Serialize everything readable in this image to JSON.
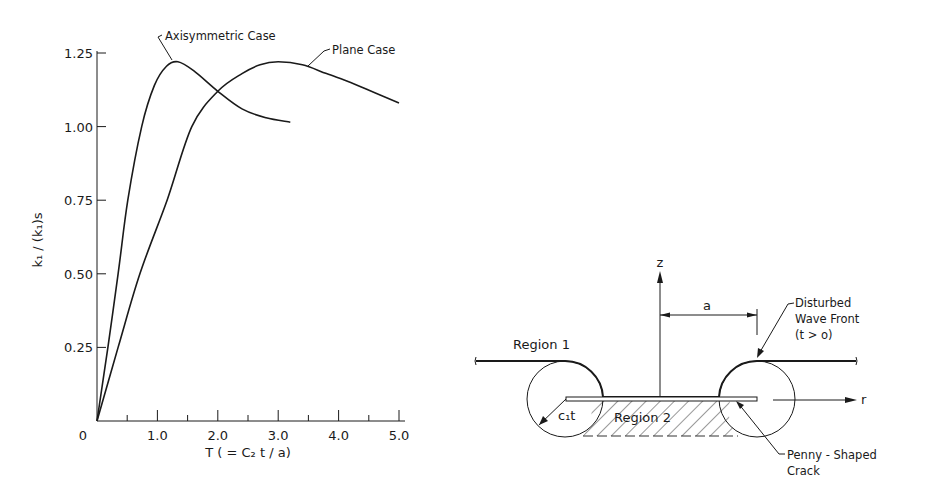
{
  "chart_data": {
    "type": "line",
    "title": "",
    "xlabel": "T ( = C₂ t / a)",
    "ylabel": "k₁ / (k₁)s",
    "xlim": [
      0,
      5.0
    ],
    "ylim": [
      0,
      1.25
    ],
    "xticks": [
      0,
      0.5,
      1.0,
      1.5,
      2.0,
      2.5,
      3.0,
      3.5,
      4.0,
      4.5,
      5.0
    ],
    "xtick_labels": [
      {
        "value": 0,
        "label": "0"
      },
      {
        "value": 1.0,
        "label": "1.0"
      },
      {
        "value": 2.0,
        "label": "2.0"
      },
      {
        "value": 3.0,
        "label": "3.0"
      },
      {
        "value": 4.0,
        "label": "4.0"
      },
      {
        "value": 5.0,
        "label": "5.0"
      }
    ],
    "ytick_labels": [
      {
        "value": 0.25,
        "label": "0.25"
      },
      {
        "value": 0.5,
        "label": "0.50"
      },
      {
        "value": 0.75,
        "label": "0.75"
      },
      {
        "value": 1.0,
        "label": "1.00"
      },
      {
        "value": 1.25,
        "label": "1.25"
      }
    ],
    "grid": false,
    "series": [
      {
        "name": "Axisymmetric Case",
        "x": [
          0,
          0.18,
          0.35,
          0.51,
          0.74,
          0.95,
          1.15,
          1.34,
          1.6,
          2.0,
          2.4,
          2.8,
          3.2
        ],
        "y": [
          0,
          0.25,
          0.5,
          0.75,
          1.0,
          1.14,
          1.205,
          1.22,
          1.19,
          1.12,
          1.06,
          1.03,
          1.015
        ]
      },
      {
        "name": "Plane Case",
        "x": [
          0,
          0.35,
          0.71,
          1.16,
          1.57,
          2.0,
          2.4,
          2.7,
          3.0,
          3.4,
          3.8,
          4.2,
          4.6,
          5.0
        ],
        "y": [
          0,
          0.25,
          0.5,
          0.75,
          1.0,
          1.12,
          1.18,
          1.21,
          1.22,
          1.21,
          1.18,
          1.15,
          1.115,
          1.08
        ]
      }
    ],
    "annotations": [
      {
        "text": "Axisymmetric Case",
        "points_to_series": "Axisymmetric Case"
      },
      {
        "text": "Plane Case",
        "points_to_series": "Plane Case"
      }
    ]
  },
  "diagram": {
    "z_axis_label": "z",
    "r_axis_label": "r",
    "dimension_label": "a",
    "region1_label": "Region 1",
    "region2_label": "Region 2",
    "radius_label": "c₁t",
    "wave_front_label_line1": "Disturbed",
    "wave_front_label_line2": "Wave Front",
    "wave_front_label_line3": "(t > o)",
    "crack_label_line1": "Penny - Shaped",
    "crack_label_line2": "Crack"
  }
}
